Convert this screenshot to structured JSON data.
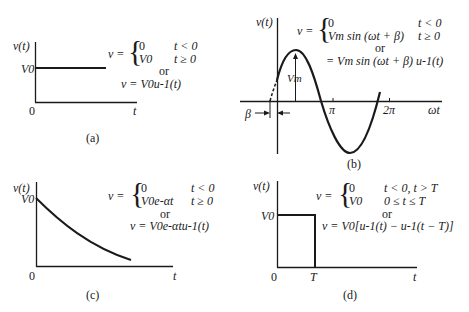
{
  "panels": {
    "a": {
      "caption": "(a)",
      "ylabel": "v(t)",
      "y_tick": "V0",
      "origin": "0",
      "xlabel": "t",
      "eq_lhs": "v =",
      "case1_val": "0",
      "case1_cond": "t < 0",
      "case2_val": "V0",
      "case2_cond": "t ≥ 0",
      "or": "or",
      "alt_eq": "v =  V0u-1(t)"
    },
    "b": {
      "caption": "(b)",
      "ylabel": "v(t)",
      "xlabel": "ωt",
      "tick_pi": "π",
      "tick_2pi": "2π",
      "amp_label": "Vm",
      "phase_label": "β",
      "eq_lhs": "v =",
      "case1_val": "0",
      "case1_cond": "t < 0",
      "case2_val": "Vm sin (ωt + β)",
      "case2_cond": "t ≥ 0",
      "or": "or",
      "alt_eq": "= Vm sin (ωt + β) u-1(t)"
    },
    "c": {
      "caption": "(c)",
      "ylabel": "v(t)",
      "y_tick": "V0",
      "origin": "0",
      "xlabel": "t",
      "eq_lhs": "v =",
      "case1_val": "0",
      "case1_cond": "t < 0",
      "case2_val": "V0e-αt",
      "case2_cond": "t ≥ 0",
      "or": "or",
      "alt_eq": "v = V0e-αtu-1(t)"
    },
    "d": {
      "caption": "(d)",
      "ylabel": "v(t)",
      "y_tick": "V0",
      "origin": "0",
      "x_tick": "T",
      "xlabel": "t",
      "eq_lhs": "v =",
      "case1_val": "0",
      "case1_cond": "t < 0, t > T",
      "case2_val": "V0",
      "case2_cond": "0 ≤ t ≤ T",
      "or": "or",
      "alt_eq": "v = V0[u-1(t) − u-1(t − T)]"
    }
  },
  "colors": {
    "ink": "#1a1a1a",
    "background": "#ffffff"
  }
}
